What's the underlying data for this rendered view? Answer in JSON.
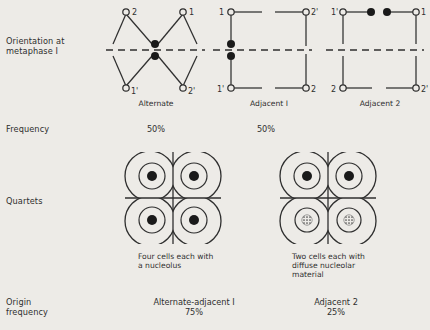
{
  "figure": {
    "background_color": "#edebe7",
    "ink_color": "#2f2f2f"
  },
  "rows": {
    "orientation": {
      "label": "Orientation at\nmetaphase I"
    },
    "frequency": {
      "label": "Frequency"
    },
    "quartets": {
      "label": "Quartets"
    },
    "origin": {
      "label": "Origin\nfrequency"
    }
  },
  "configurations": [
    {
      "name": "Alternate",
      "caption": "Alternate",
      "type": "zigzag",
      "top_labels": [
        "2",
        "1"
      ],
      "bottom_labels": [
        "1'",
        "2'"
      ],
      "centromere_dots": 2,
      "frequency": "50%"
    },
    {
      "name": "Adjacent I",
      "caption": "Adjacent I",
      "type": "parallel",
      "top_labels": [
        "1",
        "2'"
      ],
      "bottom_labels": [
        "1'",
        "2"
      ],
      "centromere_dots": 2,
      "frequency": "50%"
    },
    {
      "name": "Adjacent 2",
      "caption": "Adjacent 2",
      "type": "parallel",
      "top_labels": [
        "1'",
        "1"
      ],
      "bottom_labels": [
        "2",
        "2'"
      ],
      "centromere_dots": 2,
      "frequency": ""
    }
  ],
  "quartets": [
    {
      "id": "quartet-left",
      "cells": 4,
      "nucleoli": [
        "solid",
        "solid",
        "solid",
        "solid"
      ],
      "caption": "Four cells each with\na nucleolus"
    },
    {
      "id": "quartet-right",
      "cells": 4,
      "nucleoli": [
        "solid",
        "solid",
        "diffuse",
        "diffuse"
      ],
      "caption": "Two cells each with\ndiffuse nucleolar\nmaterial"
    }
  ],
  "origin_frequency": [
    {
      "label": "Alternate-adjacent I",
      "value": "75%"
    },
    {
      "label": "Adjacent 2",
      "value": "25%"
    }
  ]
}
